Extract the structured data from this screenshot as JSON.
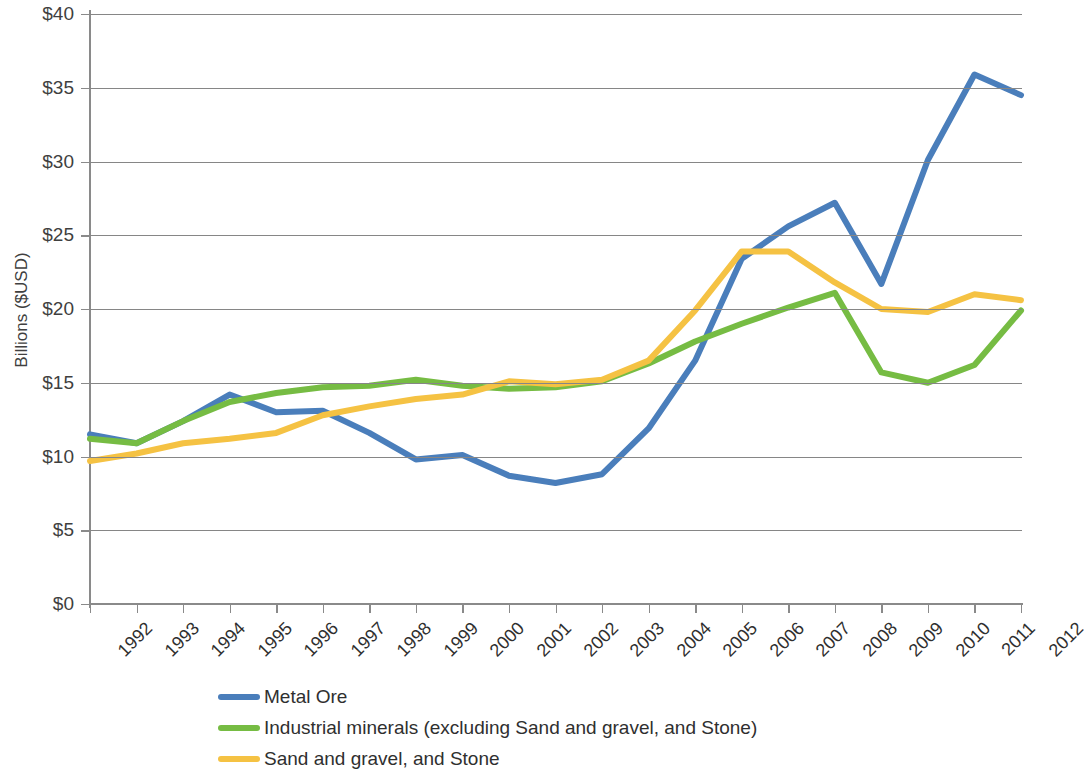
{
  "chart_data": {
    "type": "line",
    "title": "",
    "xlabel": "",
    "ylabel": "Billions ($USD)",
    "ylim": [
      0,
      40
    ],
    "ytick_labels": [
      "$0",
      "$5",
      "$10",
      "$15",
      "$20",
      "$25",
      "$30",
      "$35",
      "$40"
    ],
    "ytick_values": [
      0,
      5,
      10,
      15,
      20,
      25,
      30,
      35,
      40
    ],
    "grid": true,
    "legend_position": "bottom",
    "categories": [
      "1992",
      "1993",
      "1994",
      "1995",
      "1996",
      "1997",
      "1998",
      "1999",
      "2000",
      "2001",
      "2002",
      "2003",
      "2004",
      "2005",
      "2006",
      "2007",
      "2008",
      "2009",
      "2010",
      "2011",
      "2012"
    ],
    "x": [
      1992,
      1993,
      1994,
      1995,
      1996,
      1997,
      1998,
      1999,
      2000,
      2001,
      2002,
      2003,
      2004,
      2005,
      2006,
      2007,
      2008,
      2009,
      2010,
      2011,
      2012
    ],
    "series": [
      {
        "name": "Metal Ore",
        "color": "#4a7ebb",
        "values": [
          11.5,
          10.9,
          12.4,
          14.2,
          13.0,
          13.1,
          11.6,
          9.8,
          10.1,
          8.7,
          8.2,
          8.8,
          11.9,
          16.5,
          23.4,
          25.6,
          27.2,
          21.7,
          30.1,
          35.9,
          34.5
        ]
      },
      {
        "name": "Industrial minerals (excluding Sand and gravel, and Stone)",
        "color": "#76bc43",
        "values": [
          11.2,
          10.9,
          12.4,
          13.7,
          14.3,
          14.7,
          14.8,
          15.2,
          14.8,
          14.6,
          14.7,
          15.1,
          16.3,
          17.8,
          19.0,
          20.1,
          21.1,
          15.7,
          15.0,
          16.2,
          19.9
        ]
      },
      {
        "name": "Sand and gravel, and Stone",
        "color": "#f5c243",
        "values": [
          9.7,
          10.2,
          10.9,
          11.2,
          11.6,
          12.8,
          13.4,
          13.9,
          14.2,
          15.1,
          14.9,
          15.2,
          16.5,
          19.9,
          23.9,
          23.9,
          21.8,
          20.0,
          19.8,
          21.0,
          20.6
        ]
      }
    ]
  }
}
